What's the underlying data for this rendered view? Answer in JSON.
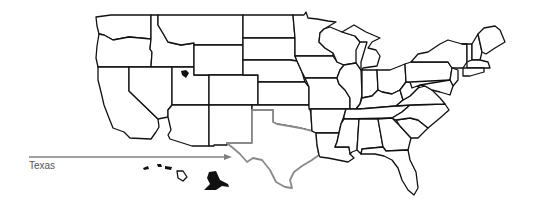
{
  "map": {
    "title": "United States",
    "highlighted_state": "Texas",
    "highlight_color": "#8a8a8a",
    "border_color": "#111111",
    "background": "#ffffff"
  },
  "annotation": {
    "label": "Texas",
    "arrow_color": "#808080"
  }
}
